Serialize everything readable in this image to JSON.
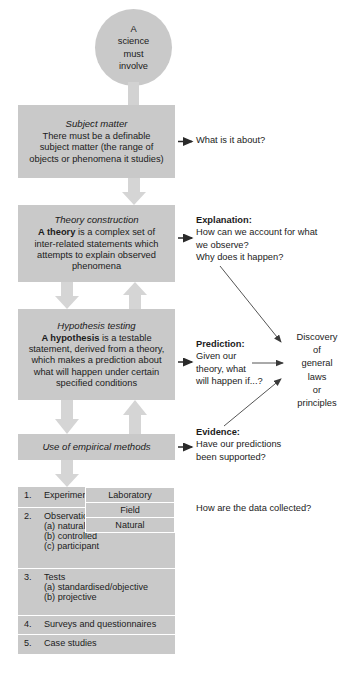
{
  "diagram": {
    "title": "A science must involve",
    "colors": {
      "box_fill": "#c9c9c9",
      "arrow_fill": "#d5d5d5",
      "divider": "#ffffff",
      "text": "#1b1b1b",
      "page_background": "#ffffff"
    }
  },
  "start_circle": {
    "lines": [
      "A",
      "science",
      "must",
      "involve"
    ]
  },
  "stages": [
    {
      "id": "subject-matter",
      "title": "Subject matter",
      "body_lines": [
        "There must be a definable",
        "subject matter (the range of",
        "objects or phenomena it studies)"
      ]
    },
    {
      "id": "theory-construction",
      "title": "Theory construction",
      "body_lines": [
        "A theory is a complex set of",
        "inter-related statements which",
        "attempts to explain observed",
        "phenomena"
      ],
      "bold_lead": "A theory"
    },
    {
      "id": "hypothesis-testing",
      "title": "Hypothesis testing",
      "body_lines": [
        "A hypothesis is a testable",
        "statement, derived from a theory,",
        "which makes a prediction about",
        "what will happen under certain",
        "specified conditions"
      ],
      "bold_lead": "A hypothesis"
    }
  ],
  "empirical_bar": {
    "label": "Use of empirical methods"
  },
  "callouts": {
    "subject": {
      "text": "What is it about?"
    },
    "explanation": {
      "heading": "Explanation:",
      "lines": [
        "How can we account for what",
        "we observe?",
        "Why does it happen?"
      ]
    },
    "prediction": {
      "heading": "Prediction:",
      "lines": [
        "Given our",
        "theory, what",
        "will happen if...?"
      ]
    },
    "evidence": {
      "heading": "Evidence:",
      "lines": [
        "Have our predictions",
        "been supported?"
      ]
    },
    "data_collection": {
      "text": "How are the data collected?"
    }
  },
  "discovery": {
    "lines": [
      "Discovery",
      "of",
      "general",
      "laws",
      "or",
      "principles"
    ]
  },
  "methods_table": {
    "rows": [
      {
        "number": "1.",
        "label": "Experiments",
        "sub_items": []
      },
      {
        "number": "2.",
        "label": "Observation",
        "sub_items": [
          "(a) naturalistic",
          "(b) controlled",
          "(c) participant"
        ]
      },
      {
        "number": "3.",
        "label": "Tests",
        "sub_items": [
          "(a) standardised/objective",
          "(b) projective"
        ]
      },
      {
        "number": "4.",
        "label": "Surveys and questionnaires",
        "sub_items": []
      },
      {
        "number": "5.",
        "label": "Case studies",
        "sub_items": []
      }
    ],
    "experiment_settings": [
      "Laboratory",
      "Field",
      "Natural"
    ]
  }
}
